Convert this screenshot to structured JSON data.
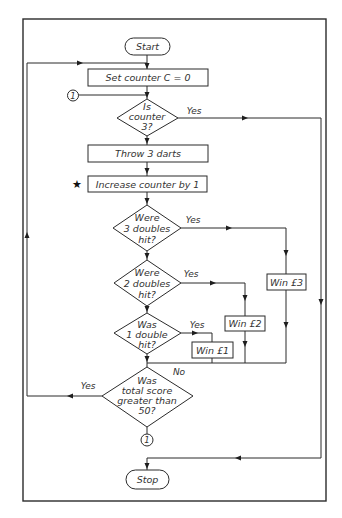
{
  "diagram": {
    "type": "flowchart",
    "colors": {
      "line": "#2b2b2b",
      "background": "#ffffff",
      "text": "#333333"
    },
    "terminals": {
      "start": "Start",
      "stop": "Stop"
    },
    "processes": {
      "set_counter": "Set counter C = 0",
      "throw_darts": "Throw 3 darts",
      "increase_counter": "Increase counter by 1"
    },
    "decisions": {
      "is_counter_3": [
        "Is",
        "counter",
        "3?"
      ],
      "three_doubles": [
        "Were",
        "3 doubles",
        "hit?"
      ],
      "two_doubles": [
        "Were",
        "2 doubles",
        "hit?"
      ],
      "one_double": [
        "Was",
        "1 double",
        "hit?"
      ],
      "score_over_50": [
        "Was",
        "total score",
        "greater than",
        "50?"
      ]
    },
    "outcomes": {
      "win3": "Win £3",
      "win2": "Win £2",
      "win1": "Win £1"
    },
    "branch_labels": {
      "yes": "Yes",
      "no": "No"
    },
    "connector": "1",
    "star_marker": "★"
  }
}
